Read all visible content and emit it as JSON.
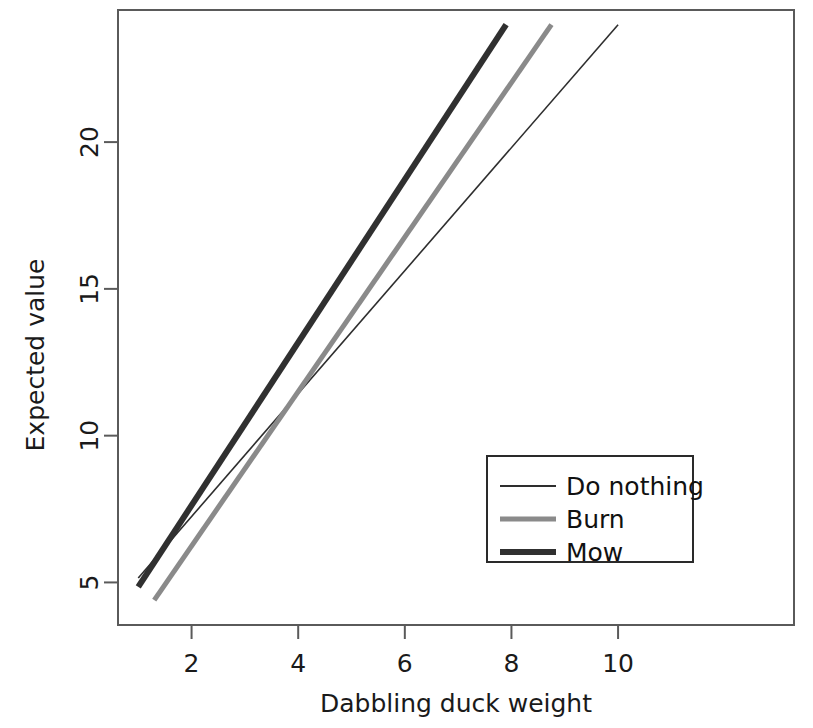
{
  "chart_data": {
    "type": "line",
    "title": "",
    "xlabel": "Dabbling duck weight",
    "ylabel": "Expected value",
    "xlim": [
      0.62,
      13.3
    ],
    "ylim": [
      3.55,
      24.5
    ],
    "xticks": [
      2,
      4,
      6,
      8,
      10
    ],
    "xtick_labels": [
      "2",
      "4",
      "6",
      "8",
      "10"
    ],
    "yticks": [
      5,
      10,
      15,
      20
    ],
    "ytick_labels": [
      "5",
      "10",
      "15",
      "20"
    ],
    "grid": false,
    "legend_position": "center-right",
    "series": [
      {
        "name": "Do nothing",
        "color": "#2e2e2e",
        "linewidth": 1.6,
        "x": [
          1.0,
          10.0
        ],
        "y": [
          5.15,
          24.0
        ]
      },
      {
        "name": "Burn",
        "color": "#8a8a8a",
        "linewidth": 5,
        "x": [
          1.3,
          8.75
        ],
        "y": [
          4.4,
          24.0
        ]
      },
      {
        "name": "Mow",
        "color": "#303030",
        "linewidth": 6,
        "x": [
          1.0,
          7.9
        ],
        "y": [
          4.85,
          24.0
        ]
      }
    ]
  },
  "axes": {
    "x_label": "Dabbling duck weight",
    "y_label": "Expected value",
    "x_tick_labels": [
      "2",
      "4",
      "6",
      "8",
      "10"
    ],
    "y_tick_labels": [
      "5",
      "10",
      "15",
      "20"
    ]
  },
  "legend": {
    "entries": [
      {
        "label": "Do nothing",
        "color": "#2e2e2e",
        "linewidth": 2
      },
      {
        "label": "Burn",
        "color": "#8a8a8a",
        "linewidth": 5
      },
      {
        "label": "Mow",
        "color": "#303030",
        "linewidth": 6
      }
    ]
  },
  "colors": {
    "axis": "#5a5a5a",
    "text": "#1a1a1a",
    "background": "#ffffff",
    "legend_border": "#2a2a2a"
  }
}
